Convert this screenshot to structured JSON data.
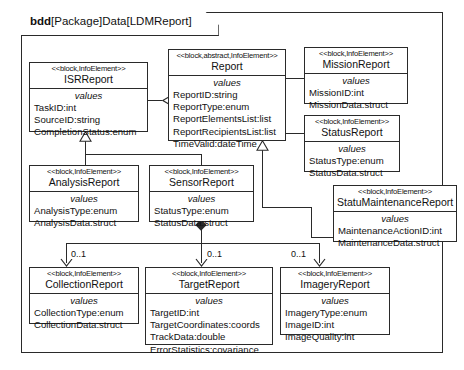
{
  "diagram": {
    "kind": "bdd",
    "title_rest": "[Package]Data[LDMReport]",
    "frame_color": "#2a2a2a"
  },
  "blocks": {
    "isr": {
      "stereotype": "<<block,InfoElement>>",
      "name": "ISRReport",
      "compartment": "values",
      "attributes": [
        "TaskID:int",
        "SourceID:string",
        "CompletionStatus:enum"
      ]
    },
    "report": {
      "stereotype": "<<block,abstract,InfoElement>>",
      "name": "Report",
      "compartment": "values",
      "attributes": [
        "ReportID:string",
        "ReportType:enum",
        "ReportElementsList:list",
        "ReportRecipientsList:list",
        "TimeValid:dateTime"
      ]
    },
    "mission": {
      "stereotype": "<<block,InfoElement>>",
      "name": "MissionReport",
      "compartment": "values",
      "attributes": [
        "MissionID:int",
        "MissionData:struct"
      ]
    },
    "status": {
      "stereotype": "<<block,InfoElement>>",
      "name": "StatusReport",
      "compartment": "values",
      "attributes": [
        "StatusType:enum",
        "StatusData:struct"
      ]
    },
    "maintenance": {
      "stereotype": "<<block,InfoElement>>",
      "name": "StatuMaintenanceReport",
      "compartment": "values",
      "attributes": [
        "MaintenanceActionID:int",
        "MaintenanceData:struct"
      ]
    },
    "analysis": {
      "stereotype": "<<block,InfoElement>>",
      "name": "AnalysisReport",
      "compartment": "values",
      "attributes": [
        "AnalysisType:enum",
        "AnalysisData:struct"
      ]
    },
    "sensor": {
      "stereotype": "<<block,InfoElement>>",
      "name": "SensorReport",
      "compartment": "values",
      "attributes": [
        "StatusType:enum",
        "StatusData:struct"
      ]
    },
    "collection": {
      "stereotype": "<<block,InfoElement>>",
      "name": "CollectionReport",
      "compartment": "values",
      "attributes": [
        "CollectionType:enum",
        "CollectionData:struct"
      ]
    },
    "target": {
      "stereotype": "<<block,InfoElement>>",
      "name": "TargetReport",
      "compartment": "values",
      "attributes": [
        "TargetID:int",
        "TargetCoordinates:coords",
        "TrackData:double",
        "ErrorStatistics:covariance"
      ]
    },
    "imagery": {
      "stereotype": "<<block,InfoElement>>",
      "name": "ImageryReport",
      "compartment": "values",
      "attributes": [
        "ImageryType:enum",
        "ImageID:int",
        "ImageQuality:int"
      ]
    }
  },
  "multiplicities": {
    "collection": "0..1",
    "target": "0..1",
    "imagery": "0..1"
  }
}
